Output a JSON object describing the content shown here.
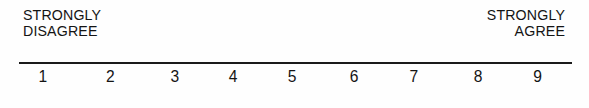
{
  "widget": {
    "kind": "likert-rating-scale",
    "point_count": 9
  },
  "anchors": {
    "low": {
      "line1": "STRONGLY",
      "line2": "DISAGREE"
    },
    "high": {
      "line1": "STRONGLY",
      "line2": "AGREE"
    }
  },
  "chart_data": {
    "type": "table",
    "title": "",
    "xlabel": "",
    "ylabel": "",
    "categories": [
      "1",
      "2",
      "3",
      "4",
      "5",
      "6",
      "7",
      "8",
      "9"
    ],
    "values": [
      1,
      2,
      3,
      4,
      5,
      6,
      7,
      8,
      9
    ],
    "tick_labels": [
      "1",
      "2",
      "3",
      "4",
      "5",
      "6",
      "7",
      "8",
      "9"
    ],
    "tick_positions_pct": [
      4.3,
      16.5,
      28.2,
      38.7,
      49.4,
      60.6,
      71.4,
      83.0,
      93.8
    ],
    "axis_range": [
      1,
      9
    ],
    "grid": false,
    "legend": "none",
    "annotations": [
      "STRONGLY DISAGREE",
      "STRONGLY AGREE"
    ]
  },
  "style": {
    "ink": "#1a1a1a",
    "paper": "#fefefe"
  }
}
